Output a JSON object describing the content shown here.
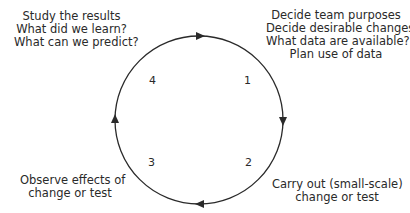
{
  "diagram": {
    "type": "cycle",
    "direction": "clockwise",
    "stages": [
      {
        "number": "1",
        "lines": [
          "Decide team purposes",
          "Decide desirable changes",
          "What data are available?",
          "Plan use of data"
        ]
      },
      {
        "number": "2",
        "lines": [
          "Carry out (small-scale)",
          "change or test"
        ]
      },
      {
        "number": "3",
        "lines": [
          "Observe effects of",
          "change or test"
        ]
      },
      {
        "number": "4",
        "lines": [
          "Study the results",
          "What did we learn?",
          "What can we predict?"
        ]
      }
    ],
    "colors": {
      "stroke": "#2a2a2a",
      "text": "#2a2a2a",
      "background": "#ffffff"
    }
  }
}
